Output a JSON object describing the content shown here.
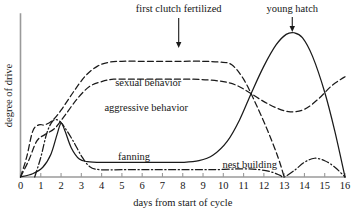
{
  "chart_data": {
    "type": "line",
    "title": "",
    "xlabel": "days from start of cycle",
    "ylabel": "degree of drive",
    "xlim": [
      0,
      16
    ],
    "ylim": [
      0,
      1
    ],
    "grid": false,
    "legend_position": "inline-labels",
    "xticks": [
      "0",
      "1",
      "2",
      "3",
      "4",
      "5",
      "6",
      "7",
      "8",
      "9",
      "10",
      "11",
      "12",
      "13",
      "14",
      "15",
      "16"
    ],
    "yticks": [],
    "annotations": [
      {
        "text": "first clutch fertilized",
        "x": 7.8,
        "pointer": "down-arrow"
      },
      {
        "text": "young hatch",
        "x": 13.4,
        "pointer": "down-arrow"
      }
    ],
    "series": [
      {
        "name": "sexual behavior",
        "style": "dashed",
        "label_x": 6.3,
        "points": [
          [
            0.0,
            0.0
          ],
          [
            0.3,
            0.12
          ],
          [
            0.6,
            0.28
          ],
          [
            0.9,
            0.32
          ],
          [
            1.2,
            0.32
          ],
          [
            1.6,
            0.35
          ],
          [
            2.0,
            0.41
          ],
          [
            2.6,
            0.52
          ],
          [
            3.2,
            0.62
          ],
          [
            3.8,
            0.68
          ],
          [
            4.4,
            0.705
          ],
          [
            5.0,
            0.71
          ],
          [
            6.0,
            0.71
          ],
          [
            7.0,
            0.71
          ],
          [
            8.0,
            0.71
          ],
          [
            9.0,
            0.71
          ],
          [
            9.8,
            0.705
          ],
          [
            10.4,
            0.69
          ],
          [
            11.0,
            0.6
          ],
          [
            11.6,
            0.45
          ],
          [
            12.2,
            0.28
          ],
          [
            12.7,
            0.12
          ],
          [
            13.0,
            0.0
          ]
        ]
      },
      {
        "name": "aggressive behavior",
        "style": "dashed",
        "label_x": 6.2,
        "points": [
          [
            0.0,
            0.0
          ],
          [
            0.4,
            0.1
          ],
          [
            0.8,
            0.22
          ],
          [
            1.2,
            0.26
          ],
          [
            1.7,
            0.3
          ],
          [
            2.2,
            0.38
          ],
          [
            2.8,
            0.48
          ],
          [
            3.4,
            0.555
          ],
          [
            4.0,
            0.585
          ],
          [
            4.6,
            0.6
          ],
          [
            5.5,
            0.6
          ],
          [
            6.5,
            0.6
          ],
          [
            7.5,
            0.6
          ],
          [
            8.5,
            0.6
          ],
          [
            9.3,
            0.595
          ],
          [
            10.0,
            0.585
          ],
          [
            10.6,
            0.565
          ],
          [
            11.2,
            0.525
          ],
          [
            11.9,
            0.47
          ],
          [
            12.6,
            0.425
          ],
          [
            13.3,
            0.4
          ],
          [
            14.0,
            0.415
          ],
          [
            14.7,
            0.48
          ],
          [
            15.3,
            0.555
          ],
          [
            15.8,
            0.6
          ],
          [
            16.0,
            0.615
          ]
        ]
      },
      {
        "name": "fanning",
        "style": "solid",
        "label_x": 5.6,
        "points": [
          [
            0.0,
            0.0
          ],
          [
            0.6,
            0.02
          ],
          [
            1.1,
            0.06
          ],
          [
            1.5,
            0.14
          ],
          [
            1.8,
            0.26
          ],
          [
            2.0,
            0.33
          ],
          [
            2.2,
            0.28
          ],
          [
            2.5,
            0.18
          ],
          [
            2.9,
            0.11
          ],
          [
            3.3,
            0.095
          ],
          [
            4.0,
            0.09
          ],
          [
            5.0,
            0.09
          ],
          [
            6.0,
            0.09
          ],
          [
            7.0,
            0.09
          ],
          [
            8.0,
            0.09
          ],
          [
            8.8,
            0.1
          ],
          [
            9.5,
            0.135
          ],
          [
            10.2,
            0.22
          ],
          [
            10.8,
            0.35
          ],
          [
            11.4,
            0.52
          ],
          [
            12.0,
            0.68
          ],
          [
            12.6,
            0.81
          ],
          [
            13.1,
            0.875
          ],
          [
            13.5,
            0.885
          ],
          [
            13.9,
            0.855
          ],
          [
            14.4,
            0.74
          ],
          [
            15.0,
            0.52
          ],
          [
            15.5,
            0.28
          ],
          [
            16.0,
            0.0
          ]
        ]
      },
      {
        "name": "nest building",
        "style": "dash-dot",
        "label_x": 11.0,
        "points": [
          [
            0.7,
            0.0
          ],
          [
            1.0,
            0.12
          ],
          [
            1.3,
            0.27
          ],
          [
            1.6,
            0.345
          ],
          [
            1.9,
            0.345
          ],
          [
            2.2,
            0.3
          ],
          [
            2.6,
            0.22
          ],
          [
            3.0,
            0.13
          ],
          [
            3.4,
            0.065
          ],
          [
            3.9,
            0.045
          ],
          [
            5.0,
            0.045
          ],
          [
            6.5,
            0.045
          ],
          [
            8.0,
            0.045
          ],
          [
            9.5,
            0.045
          ],
          [
            11.0,
            0.05
          ],
          [
            11.8,
            0.045
          ],
          [
            12.4,
            0.03
          ],
          [
            12.8,
            0.01
          ],
          [
            13.0,
            0.0
          ],
          [
            13.5,
            0.04
          ],
          [
            14.0,
            0.09
          ],
          [
            14.5,
            0.115
          ],
          [
            15.0,
            0.1
          ],
          [
            15.5,
            0.06
          ],
          [
            16.0,
            0.0
          ]
        ]
      }
    ]
  }
}
